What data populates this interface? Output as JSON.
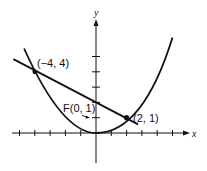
{
  "diagram": {
    "type": "coordinate-plot",
    "axes": {
      "x_label": "x",
      "y_label": "y",
      "x_ticks": [
        -5,
        -4,
        -3,
        -2,
        -1,
        1,
        2,
        3,
        4,
        5
      ],
      "y_ticks": [
        1,
        2,
        3,
        4,
        5
      ]
    },
    "curves": [
      {
        "name": "parabola",
        "equation": "x^2 = 4y",
        "x_range": [
          -4.7,
          5
        ]
      },
      {
        "name": "line",
        "equation": "y = -x/2 + 2",
        "x_range": [
          -5.4,
          2.75
        ]
      }
    ],
    "points": [
      {
        "label": "(−4, 4)",
        "x": -4,
        "y": 4
      },
      {
        "label": "(2, 1)",
        "x": 2,
        "y": 1
      }
    ],
    "focus": {
      "label": "F(0, 1)",
      "x": 0,
      "y": 1
    },
    "colors": {
      "ink": "#111111",
      "background": "#ffffff"
    }
  }
}
